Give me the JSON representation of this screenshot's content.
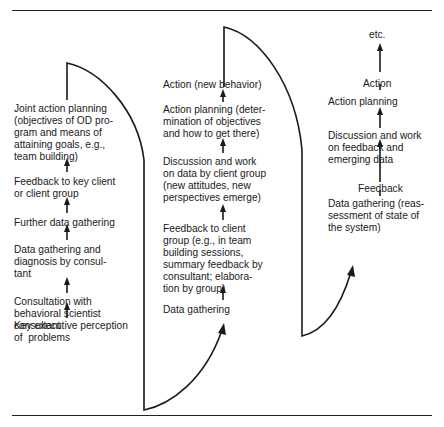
{
  "figure": {
    "column1": {
      "steps": [
        "Key executive perception\nof  problems",
        "Consultation with\nbehavioral scientist\nconsultant",
        "Data gathering and\ndiagnosis by consul-\ntant",
        "Further data gathering",
        "Feedback to key client\nor client group",
        "Joint action planning\n(objectives of OD pro-\ngram and means of\nattaining goals, e.g.,\nteam building)"
      ]
    },
    "column2": {
      "steps": [
        "Data gathering",
        "Feedback to client\ngroup (e.g., in team\nbuilding sessions,\nsummary feedback by\nconsultant; elabora-\ntion by group)",
        "Discussion and work\non data by client group\n(new attitudes, new\nperspectives emerge)",
        "Action planning (deter-\nmination of objectives\nand how to get there)",
        "Action (new behavior)"
      ]
    },
    "column3": {
      "steps": [
        "Data gathering (reas-\nsessment of state of\nthe system)",
        "Feedback",
        "Discussion and work\non feedback and\nemerging data",
        "Action planning",
        "Action",
        "etc."
      ]
    },
    "colors": {
      "ink": "#1a1a1a",
      "background": "#ffffff"
    }
  }
}
